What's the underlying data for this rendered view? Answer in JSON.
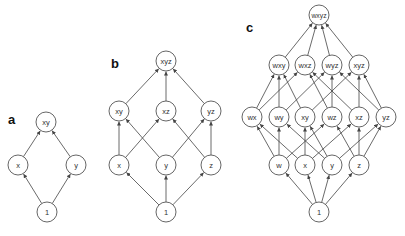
{
  "node_radius": 10,
  "colors": {
    "node_stroke": "#555555",
    "edge": "#444444",
    "label": "#111111"
  },
  "panels": [
    {
      "label": "a",
      "label_pos": [
        8,
        124
      ],
      "nodes": [
        {
          "id": "xy",
          "text": "xy",
          "x": 46,
          "y": 122
        },
        {
          "id": "x",
          "text": "x",
          "x": 18,
          "y": 165
        },
        {
          "id": "y",
          "text": "y",
          "x": 76,
          "y": 165
        },
        {
          "id": "1",
          "text": "1",
          "x": 47,
          "y": 212
        }
      ],
      "edges": [
        [
          "1",
          "x"
        ],
        [
          "1",
          "y"
        ],
        [
          "x",
          "xy"
        ],
        [
          "y",
          "xy"
        ]
      ]
    },
    {
      "label": "b",
      "label_pos": [
        111,
        68
      ],
      "nodes": [
        {
          "id": "xyz",
          "text": "xyz",
          "x": 166,
          "y": 61
        },
        {
          "id": "xy",
          "text": "xy",
          "x": 119,
          "y": 111
        },
        {
          "id": "xz",
          "text": "xz",
          "x": 166,
          "y": 111
        },
        {
          "id": "yz",
          "text": "yz",
          "x": 211,
          "y": 111
        },
        {
          "id": "x",
          "text": "x",
          "x": 119,
          "y": 165
        },
        {
          "id": "y",
          "text": "y",
          "x": 166,
          "y": 165
        },
        {
          "id": "z",
          "text": "z",
          "x": 211,
          "y": 165
        },
        {
          "id": "1",
          "text": "1",
          "x": 166,
          "y": 212
        }
      ],
      "edges": [
        [
          "1",
          "x"
        ],
        [
          "1",
          "y"
        ],
        [
          "1",
          "z"
        ],
        [
          "x",
          "xy"
        ],
        [
          "x",
          "xz"
        ],
        [
          "y",
          "xy"
        ],
        [
          "y",
          "yz"
        ],
        [
          "z",
          "xz"
        ],
        [
          "z",
          "yz"
        ],
        [
          "xy",
          "xyz"
        ],
        [
          "xz",
          "xyz"
        ],
        [
          "yz",
          "xyz"
        ]
      ]
    },
    {
      "label": "c",
      "label_pos": [
        246,
        32
      ],
      "nodes": [
        {
          "id": "wxyz",
          "text": "wxyz",
          "x": 319,
          "y": 15
        },
        {
          "id": "wxy",
          "text": "wxy",
          "x": 279,
          "y": 65
        },
        {
          "id": "wxz",
          "text": "wxz",
          "x": 305,
          "y": 65
        },
        {
          "id": "wyz",
          "text": "wyz",
          "x": 332,
          "y": 65
        },
        {
          "id": "xyz",
          "text": "xyz",
          "x": 359,
          "y": 65
        },
        {
          "id": "wx",
          "text": "wx",
          "x": 252,
          "y": 117
        },
        {
          "id": "wy",
          "text": "wy",
          "x": 279,
          "y": 117
        },
        {
          "id": "xy",
          "text": "xy",
          "x": 305,
          "y": 117
        },
        {
          "id": "wz",
          "text": "wz",
          "x": 332,
          "y": 117
        },
        {
          "id": "xz",
          "text": "xz",
          "x": 359,
          "y": 117
        },
        {
          "id": "yz",
          "text": "yz",
          "x": 386,
          "y": 117
        },
        {
          "id": "w",
          "text": "w",
          "x": 279,
          "y": 165
        },
        {
          "id": "x",
          "text": "x",
          "x": 305,
          "y": 165
        },
        {
          "id": "y",
          "text": "y",
          "x": 332,
          "y": 165
        },
        {
          "id": "z",
          "text": "z",
          "x": 359,
          "y": 165
        },
        {
          "id": "1",
          "text": "1",
          "x": 319,
          "y": 212
        }
      ],
      "edges": [
        [
          "1",
          "w"
        ],
        [
          "1",
          "x"
        ],
        [
          "1",
          "y"
        ],
        [
          "1",
          "z"
        ],
        [
          "w",
          "wx"
        ],
        [
          "w",
          "wy"
        ],
        [
          "w",
          "wz"
        ],
        [
          "x",
          "wx"
        ],
        [
          "x",
          "xy"
        ],
        [
          "x",
          "xz"
        ],
        [
          "y",
          "wy"
        ],
        [
          "y",
          "xy"
        ],
        [
          "y",
          "yz"
        ],
        [
          "z",
          "wz"
        ],
        [
          "z",
          "xz"
        ],
        [
          "z",
          "yz"
        ],
        [
          "wx",
          "wxy"
        ],
        [
          "wx",
          "wxz"
        ],
        [
          "wy",
          "wxy"
        ],
        [
          "wy",
          "wyz"
        ],
        [
          "xy",
          "wxy"
        ],
        [
          "xy",
          "xyz"
        ],
        [
          "wz",
          "wxz"
        ],
        [
          "wz",
          "wyz"
        ],
        [
          "xz",
          "wxz"
        ],
        [
          "xz",
          "xyz"
        ],
        [
          "yz",
          "wyz"
        ],
        [
          "yz",
          "xyz"
        ],
        [
          "wxy",
          "wxyz"
        ],
        [
          "wxz",
          "wxyz"
        ],
        [
          "wyz",
          "wxyz"
        ],
        [
          "xyz",
          "wxyz"
        ]
      ]
    }
  ]
}
